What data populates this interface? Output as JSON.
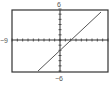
{
  "chart_data": {
    "type": "line",
    "title": "",
    "xlabel": "",
    "ylabel": "",
    "xlim": [
      -9,
      9
    ],
    "ylim": [
      -6,
      6
    ],
    "tick_labels": {
      "top": "6",
      "bottom": "-6",
      "left": "-9",
      "right": "9"
    },
    "grid": false,
    "series": [
      {
        "name": "y = x - 2",
        "x": [
          -4,
          9
        ],
        "y": [
          -6,
          7
        ]
      }
    ],
    "colors": {
      "line": "#555555",
      "axis": "#333333"
    }
  }
}
